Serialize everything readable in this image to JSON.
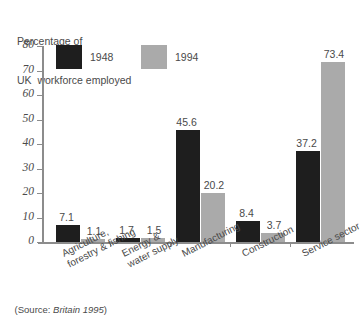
{
  "chart_data": {
    "type": "bar",
    "title": "Percentage of UK  workforce employed",
    "title_lines": [
      "Percentage of",
      "UK  workforce employed"
    ],
    "xlabel": "",
    "ylabel": "",
    "ylim": [
      0,
      80
    ],
    "yticks": [
      0,
      10,
      20,
      30,
      40,
      50,
      60,
      70,
      80
    ],
    "grid": false,
    "legend_position": "top-left",
    "categories": [
      "Agriculture, forestry & fishing",
      "Energy & water supply",
      "Manufacturing",
      "Construction",
      "Service sector"
    ],
    "category_lines": [
      [
        "Agriculture,",
        "forestry & fishing"
      ],
      [
        "Energy &",
        "water supply"
      ],
      [
        "Manufacturing"
      ],
      [
        "Construction"
      ],
      [
        "Service sector"
      ]
    ],
    "series": [
      {
        "name": "1948",
        "color": "#1e1e1e",
        "values": [
          7.1,
          1.7,
          45.6,
          8.4,
          37.2
        ]
      },
      {
        "name": "1994",
        "color": "#aaaaaa",
        "values": [
          1.1,
          1.5,
          20.2,
          3.7,
          73.4
        ]
      }
    ],
    "value_labels": {
      "1948": [
        "7.1",
        "1.7",
        "45.6",
        "8.4",
        "37.2"
      ],
      "1994": [
        "1.1",
        "1.5",
        "20.2",
        "3.7",
        "73.4"
      ]
    },
    "source_prefix": "(Source: ",
    "source_italic": "Britain 1995",
    "source_suffix": ")"
  },
  "legend": {
    "items": [
      {
        "label": "1948",
        "color": "#1e1e1e"
      },
      {
        "label": "1994",
        "color": "#aaaaaa"
      }
    ]
  },
  "axis": {
    "tick_labels": [
      "80",
      "70",
      "60",
      "50",
      "40",
      "30",
      "20",
      "10",
      "0"
    ]
  }
}
